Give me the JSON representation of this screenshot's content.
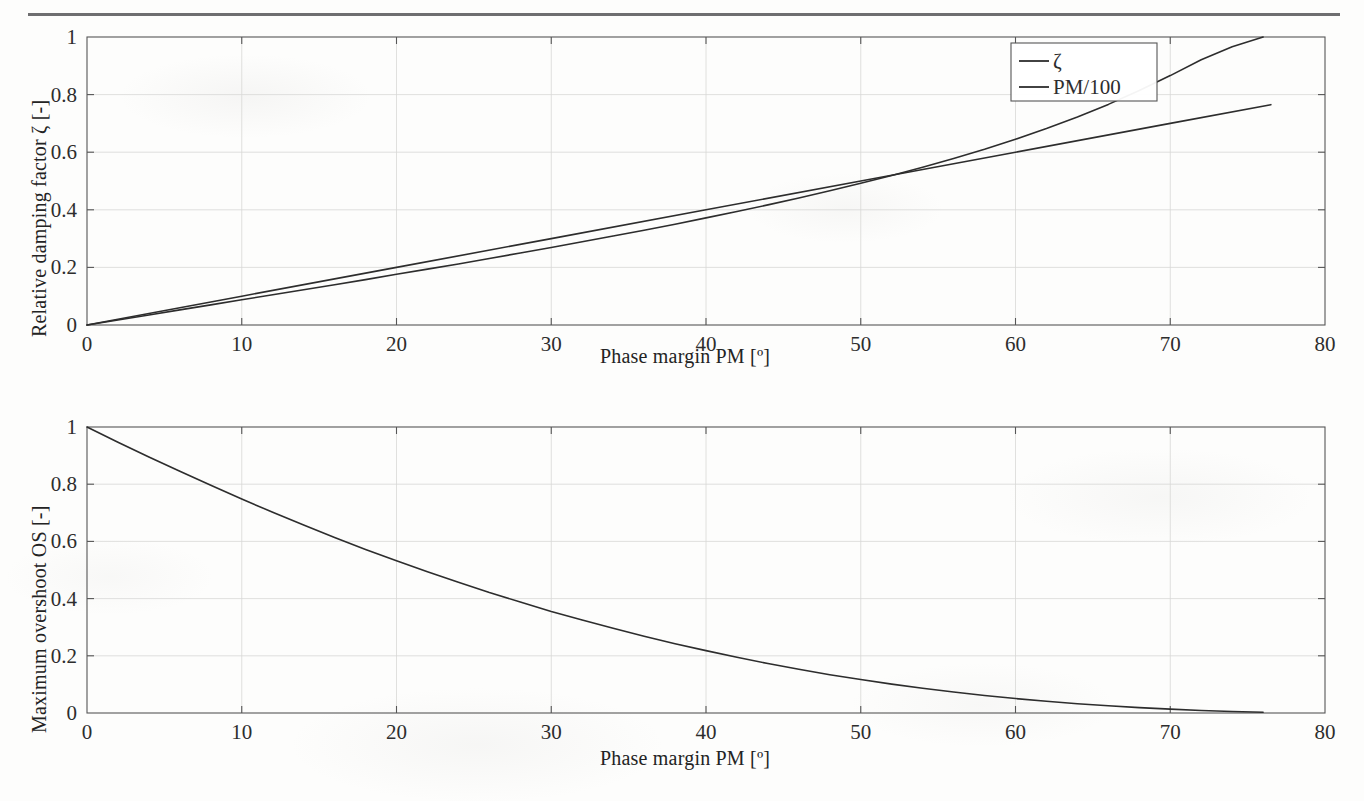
{
  "figure": {
    "type": "scanned-figure",
    "background_color": "#fdfdfc",
    "ink_color": "#2d2d2d",
    "rule_color": "#6e6e70"
  },
  "chart_data": [
    {
      "id": "top",
      "type": "line",
      "title": "",
      "xlabel": "Phase margin PM [º]",
      "ylabel": "Relative damping factor ζ [-]",
      "xlim": [
        0,
        80
      ],
      "ylim": [
        0,
        1
      ],
      "xticks": [
        0,
        10,
        20,
        30,
        40,
        50,
        60,
        70,
        80
      ],
      "xticklabels": [
        "0",
        "10",
        "20",
        "30",
        "40",
        "50",
        "60",
        "70",
        "80"
      ],
      "yticks": [
        0,
        0.2,
        0.4,
        0.6,
        0.8,
        1
      ],
      "yticklabels": [
        "0",
        "0.2",
        "0.4",
        "0.6",
        "0.8",
        "1"
      ],
      "grid": true,
      "legend_position": "top-right",
      "series": [
        {
          "name": "ζ",
          "color": "#2d2d2d",
          "x": [
            0,
            2,
            4,
            6,
            8,
            10,
            12,
            14,
            16,
            18,
            20,
            22,
            24,
            26,
            28,
            30,
            32,
            34,
            36,
            38,
            40,
            42,
            44,
            46,
            48,
            50,
            52,
            54,
            56,
            58,
            60,
            62,
            64,
            66,
            68,
            70,
            72,
            74,
            76
          ],
          "y": [
            0,
            0.0175,
            0.035,
            0.0525,
            0.07,
            0.0875,
            0.105,
            0.1225,
            0.14,
            0.1575,
            0.176,
            0.194,
            0.212,
            0.231,
            0.25,
            0.269,
            0.289,
            0.309,
            0.329,
            0.35,
            0.372,
            0.394,
            0.417,
            0.441,
            0.466,
            0.492,
            0.519,
            0.548,
            0.578,
            0.61,
            0.645,
            0.682,
            0.722,
            0.766,
            0.814,
            0.866,
            0.921,
            0.966,
            1.0
          ]
        },
        {
          "name": "PM/100",
          "color": "#2d2d2d",
          "x": [
            0,
            10,
            20,
            30,
            40,
            50,
            60,
            70,
            76.5
          ],
          "y": [
            0,
            0.1,
            0.2,
            0.3,
            0.4,
            0.5,
            0.6,
            0.7,
            0.765
          ]
        }
      ]
    },
    {
      "id": "bottom",
      "type": "line",
      "title": "",
      "xlabel": "Phase margin PM [º]",
      "ylabel": "Maximum overshoot OS [-]",
      "xlim": [
        0,
        80
      ],
      "ylim": [
        0,
        1
      ],
      "xticks": [
        0,
        10,
        20,
        30,
        40,
        50,
        60,
        70,
        80
      ],
      "xticklabels": [
        "0",
        "10",
        "20",
        "30",
        "40",
        "50",
        "60",
        "70",
        "80"
      ],
      "yticks": [
        0,
        0.2,
        0.4,
        0.6,
        0.8,
        1
      ],
      "yticklabels": [
        "0",
        "0.2",
        "0.4",
        "0.6",
        "0.8",
        "1"
      ],
      "grid": true,
      "legend_position": "none",
      "series": [
        {
          "name": "OS",
          "color": "#2d2d2d",
          "x": [
            0,
            2,
            4,
            6,
            8,
            10,
            12,
            14,
            16,
            18,
            20,
            22,
            24,
            26,
            28,
            30,
            32,
            34,
            36,
            38,
            40,
            42,
            44,
            46,
            48,
            50,
            52,
            54,
            56,
            58,
            60,
            62,
            64,
            66,
            68,
            70,
            72,
            74,
            76
          ],
          "y": [
            1.0,
            0.947,
            0.895,
            0.845,
            0.796,
            0.748,
            0.702,
            0.657,
            0.614,
            0.572,
            0.532,
            0.494,
            0.457,
            0.421,
            0.388,
            0.355,
            0.325,
            0.296,
            0.268,
            0.242,
            0.218,
            0.195,
            0.173,
            0.153,
            0.134,
            0.117,
            0.101,
            0.0865,
            0.0733,
            0.0614,
            0.0506,
            0.0411,
            0.0326,
            0.0252,
            0.0188,
            0.0134,
            0.0089,
            0.0053,
            0.0025
          ]
        }
      ]
    }
  ]
}
